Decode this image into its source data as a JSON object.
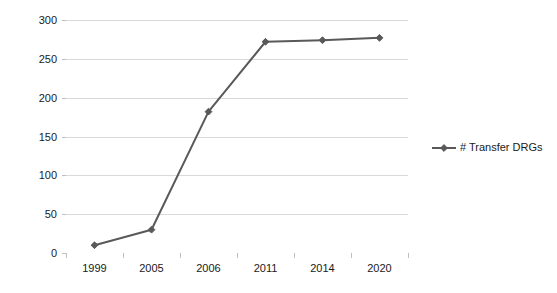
{
  "chart_data": {
    "type": "line",
    "title": "",
    "subtitle": "",
    "xlabel": "",
    "ylabel": "",
    "categories": [
      "1999",
      "2005",
      "2006",
      "2011",
      "2014",
      "2020"
    ],
    "series": [
      {
        "name": "# Transfer DRGs",
        "values": [
          10,
          30,
          182,
          272,
          274,
          277
        ],
        "color": "#595959",
        "marker": "diamond"
      }
    ],
    "ylim": [
      0,
      300
    ],
    "ytick_step": 50,
    "ytick_labels": [
      "300",
      "250",
      "200",
      "150",
      "100",
      "50",
      "0"
    ],
    "ytick_values": [
      300,
      250,
      200,
      150,
      100,
      50,
      0
    ],
    "grid": {
      "horizontal": true,
      "vertical": false,
      "color": "#d9d9d9"
    },
    "legend": {
      "position": "right",
      "entries": [
        {
          "label": "# Transfer DRGs",
          "color": "#595959",
          "marker": "diamond"
        }
      ]
    },
    "axis": {
      "line_color": "#bfbfbf",
      "tick_color": "#bfbfbf",
      "label_color": "#1a1a1a"
    },
    "background": "#ffffff"
  }
}
